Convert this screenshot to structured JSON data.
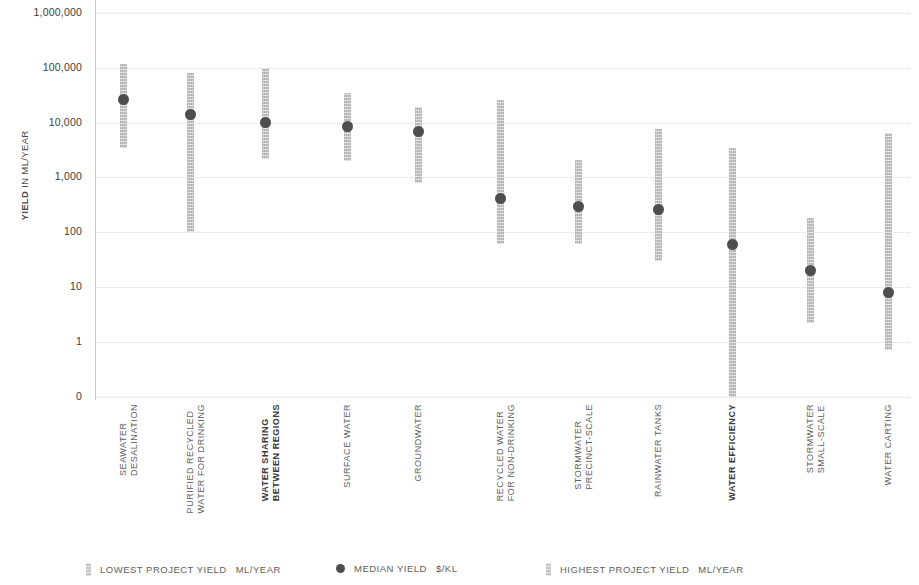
{
  "axis": {
    "y_title_bold": "YIELD",
    "y_title_rest": " IN ML/YEAR",
    "y_ticks": [
      "1,000,000",
      "100,000",
      "10,000",
      "1,000",
      "100",
      "10",
      "1",
      "0"
    ]
  },
  "legend": {
    "items": [
      {
        "marker": "bar",
        "label": "LOWEST PROJECT YIELD",
        "unit": "ML/YEAR"
      },
      {
        "marker": "dot",
        "label": "MEDIAN YIELD",
        "unit": "$/KL"
      },
      {
        "marker": "bar",
        "label": "HIGHEST PROJECT YIELD",
        "unit": "ML/YEAR"
      }
    ]
  },
  "chart_data": {
    "type": "bar",
    "title": "",
    "xlabel": "",
    "ylabel": "YIELD IN ML/YEAR",
    "y_scale": "log",
    "ylim": [
      0,
      1000000
    ],
    "y_ticks": [
      1000000,
      100000,
      10000,
      1000,
      100,
      10,
      1,
      0
    ],
    "grid": true,
    "legend_position": "bottom",
    "categories": [
      "SEAWATER DESALINATION",
      "PURIFIED RECYCLED WATER FOR DRINKING",
      "WATER SHARING BETWEEN REGIONS",
      "SURFACE WATER",
      "GROUNDWATER",
      "RECYCLED WATER FOR NON-DRINKING",
      "STORMWATER PRECINCT-SCALE",
      "RAINWATER TANKS",
      "WATER EFFICIENCY",
      "STORMWATER SMALL-SCALE",
      "WATER CARTING"
    ],
    "series": [
      {
        "name": "LOWEST PROJECT YIELD",
        "unit": "ML/YEAR",
        "values": [
          3500,
          100,
          2200,
          2000,
          800,
          60,
          60,
          30,
          0.1,
          2.2,
          0.7
        ]
      },
      {
        "name": "MEDIAN YIELD",
        "unit": "$/KL",
        "values": [
          26000,
          14000,
          10000,
          8500,
          7000,
          420,
          300,
          260,
          60,
          20,
          8
        ]
      },
      {
        "name": "HIGHEST PROJECT YIELD",
        "unit": "ML/YEAR",
        "values": [
          115000,
          80000,
          100000,
          34000,
          19000,
          26000,
          2100,
          7500,
          3500,
          180,
          6500
        ]
      }
    ],
    "bars": [
      {
        "category": "SEAWATER DESALINATION",
        "low": 3500,
        "median": 26000,
        "high": 115000,
        "bold_label": false,
        "label_line1": "SEAWATER",
        "label_line2": "DESALINATION"
      },
      {
        "category": "PURIFIED RECYCLED WATER FOR DRINKING",
        "low": 100,
        "median": 14000,
        "high": 80000,
        "bold_label": false,
        "label_line1": "PURIFIED RECYCLED",
        "label_line2": "WATER FOR DRINKING"
      },
      {
        "category": "WATER SHARING BETWEEN REGIONS",
        "low": 2200,
        "median": 10000,
        "high": 100000,
        "bold_label": true,
        "label_line1": "WATER SHARING",
        "label_line2": "BETWEEN REGIONS"
      },
      {
        "category": "SURFACE WATER",
        "low": 2000,
        "median": 8500,
        "high": 34000,
        "bold_label": false,
        "label_line1": "SURFACE WATER",
        "label_line2": ""
      },
      {
        "category": "GROUNDWATER",
        "low": 800,
        "median": 7000,
        "high": 19000,
        "bold_label": false,
        "label_line1": "GROUNDWATER",
        "label_line2": ""
      },
      {
        "category": "RECYCLED WATER FOR NON-DRINKING",
        "low": 60,
        "median": 420,
        "high": 26000,
        "bold_label": false,
        "label_line1": "RECYCLED WATER",
        "label_line2": "FOR NON-DRINKING"
      },
      {
        "category": "STORMWATER PRECINCT-SCALE",
        "low": 60,
        "median": 300,
        "high": 2100,
        "bold_label": false,
        "label_line1": "STORMWATER",
        "label_line2": "PRECINCT-SCALE"
      },
      {
        "category": "RAINWATER TANKS",
        "low": 30,
        "median": 260,
        "high": 7500,
        "bold_label": false,
        "label_line1": "RAINWATER TANKS",
        "label_line2": ""
      },
      {
        "category": "WATER EFFICIENCY",
        "low": 0.1,
        "median": 60,
        "high": 3500,
        "bold_label": true,
        "label_line1": "WATER EFFICIENCY",
        "label_line2": ""
      },
      {
        "category": "STORMWATER SMALL-SCALE",
        "low": 2.2,
        "median": 20,
        "high": 180,
        "bold_label": false,
        "label_line1": "STORMWATER",
        "label_line2": "SMALL-SCALE"
      },
      {
        "category": "WATER CARTING",
        "low": 0.7,
        "median": 8,
        "high": 6500,
        "bold_label": false,
        "label_line1": "WATER CARTING",
        "label_line2": ""
      }
    ]
  },
  "colors": {
    "bar": "#c6c6c6",
    "dot": "#4e4e4e",
    "grid": "#d9d9d9",
    "text": "#5e5e5e"
  }
}
